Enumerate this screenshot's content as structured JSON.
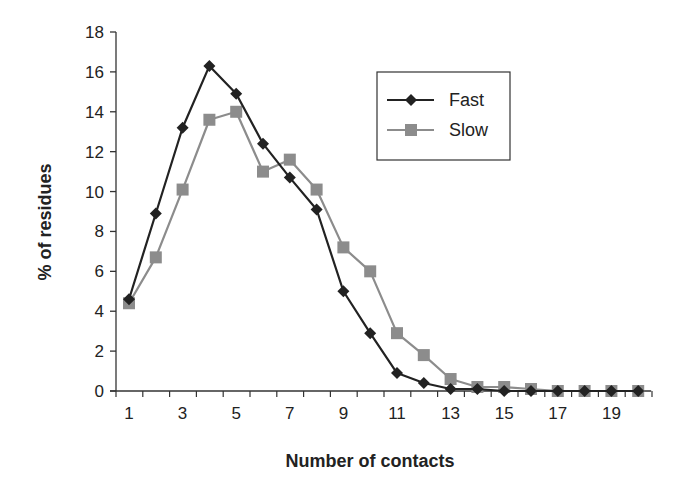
{
  "chart_data": {
    "type": "line",
    "title": "",
    "xlabel": "Number of contacts",
    "ylabel": "% of residues",
    "x": [
      1,
      2,
      3,
      4,
      5,
      6,
      7,
      8,
      9,
      10,
      11,
      12,
      13,
      14,
      15,
      16,
      17,
      18,
      19,
      20
    ],
    "x_tick_labels": [
      "1",
      "3",
      "5",
      "7",
      "9",
      "11",
      "13",
      "15",
      "17",
      "19"
    ],
    "y_tick_labels": [
      "0",
      "2",
      "4",
      "6",
      "8",
      "10",
      "12",
      "14",
      "16",
      "18"
    ],
    "ylim": [
      0,
      18
    ],
    "xlim": [
      1,
      20
    ],
    "grid": false,
    "legend_position": "upper right (inside)",
    "series": [
      {
        "name": "Fast",
        "color": "#222222",
        "marker": "diamond",
        "values": [
          4.6,
          8.9,
          13.2,
          16.3,
          14.9,
          12.4,
          10.7,
          9.1,
          5.0,
          2.9,
          0.9,
          0.4,
          0.1,
          0.1,
          0.0,
          0.0,
          0.0,
          0.0,
          0.0,
          0.0
        ]
      },
      {
        "name": "Slow",
        "color": "#8c8c8c",
        "marker": "square",
        "values": [
          4.4,
          6.7,
          10.1,
          13.6,
          14.0,
          11.0,
          11.6,
          10.1,
          7.2,
          6.0,
          2.9,
          1.8,
          0.6,
          0.2,
          0.2,
          0.1,
          0.0,
          0.0,
          0.0,
          0.0
        ]
      }
    ]
  },
  "legend": {
    "items": [
      {
        "label": "Fast"
      },
      {
        "label": "Slow"
      }
    ]
  },
  "axes": {
    "xlabel": "Number of contacts",
    "ylabel": "% of residues"
  }
}
